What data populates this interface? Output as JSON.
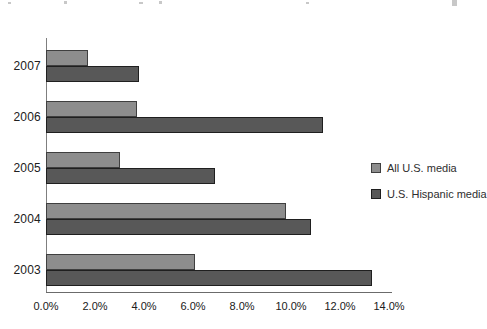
{
  "figure": {
    "background": "#ffffff",
    "accent_colors": {
      "light_bar": "#8d8d8d",
      "dark_bar": "#585858",
      "axis": "#6b6b6b",
      "text": "#202020"
    }
  },
  "chart_data": {
    "type": "bar",
    "orientation": "horizontal",
    "title": "",
    "xlabel": "",
    "ylabel": "",
    "categories": [
      "2007",
      "2006",
      "2005",
      "2004",
      "2003"
    ],
    "series": [
      {
        "name": "All U.S. media",
        "color": "#8d8d8d",
        "border_color": "#3f3f3f",
        "values": [
          1.7,
          3.7,
          3.0,
          9.8,
          6.1
        ]
      },
      {
        "name": "U.S. Hispanic media",
        "color": "#585858",
        "border_color": "#1f1f1f",
        "values": [
          3.8,
          11.3,
          6.9,
          10.8,
          13.3
        ]
      }
    ],
    "x_axis": {
      "ticks": [
        "0.0%",
        "2.0%",
        "4.0%",
        "6.0%",
        "8.0%",
        "10.0%",
        "12.0%",
        "14.0%"
      ],
      "min": 0,
      "max": 14,
      "unit": "percent"
    },
    "grid": false,
    "legend": {
      "position": "right",
      "entries": [
        "All U.S. media",
        "U.S. Hispanic media"
      ]
    }
  }
}
